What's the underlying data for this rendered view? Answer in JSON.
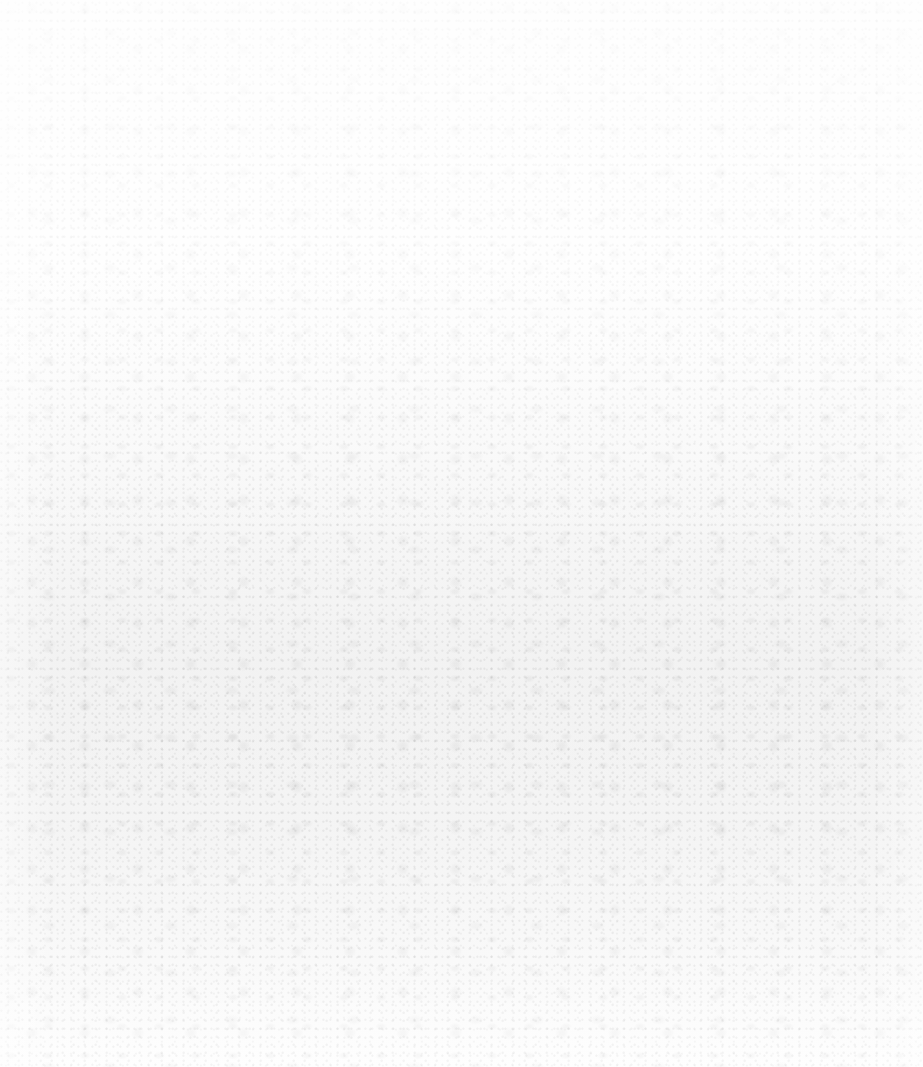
{
  "page": {
    "type": "blank-textured-paper",
    "background_color": "#fdfdfd",
    "texture_color": "#b4b4b4",
    "texture_style": "mottled grey noise",
    "texture_distribution": "light at top, denser in the middle-to-lower band, fading toward the bottom and side edges",
    "visible_text": []
  }
}
